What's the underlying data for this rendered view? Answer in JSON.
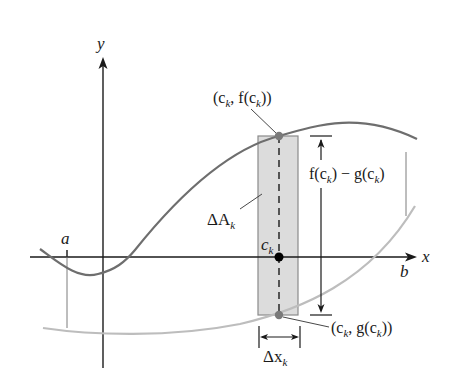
{
  "figure": {
    "colors": {
      "axis": "#1a1a1a",
      "f_curve": "#6e6e6e",
      "g_curve": "#bdbdbd",
      "rectangle_fill": "#dcdcdc",
      "rectangle_stroke": "#8a8a8a",
      "point_f": "#7a7a7a",
      "point_ck": "#000000",
      "point_g": "#7a7a7a"
    },
    "labels": {
      "y_axis": "y",
      "x_axis": "x",
      "a": "a",
      "b": "b",
      "point_f_open": "(c",
      "point_f_sub": "k",
      "point_f_mid": ", f(c",
      "point_f_close": "))",
      "height_f": "f(c",
      "height_sub1": "k",
      "height_mid": ") − g(c",
      "height_sub2": "k",
      "height_close": ")",
      "area_delta": "ΔA",
      "area_sub": "k",
      "ck_main": "c",
      "ck_sub": "k",
      "point_g_open": "(c",
      "point_g_sub": "k",
      "point_g_mid": ", g(c",
      "point_g_close": "))",
      "width_delta": "Δx",
      "width_sub": "k"
    }
  }
}
